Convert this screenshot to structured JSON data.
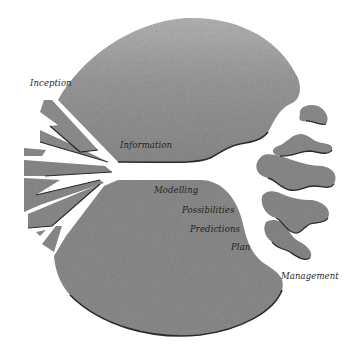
{
  "diagram": {
    "title": "",
    "colors": {
      "background": "#ffffff",
      "shape_fill": "#8e8e8e",
      "shape_fill_light": "#a9a9a9",
      "outline": "#2a2a2a",
      "label": "#1f1f1f"
    },
    "labels": {
      "inception": "Inception",
      "information": "Information",
      "modelling": "Modelling",
      "possibilities": "Possibilities",
      "predictions": "Predictions",
      "plan": "Plan",
      "management": "Management"
    }
  }
}
